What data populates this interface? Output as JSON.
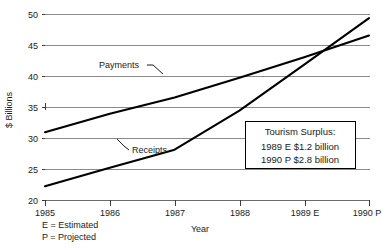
{
  "chart_data": {
    "type": "line",
    "title": "",
    "xlabel": "Year",
    "ylabel": "$ Billions",
    "grid": true,
    "legend_position": "inline-annotation",
    "categories": [
      "1985",
      "1986",
      "1987",
      "1988",
      "1989 E",
      "1990 P"
    ],
    "x": [
      1985,
      1986,
      1987,
      1988,
      1989,
      1990
    ],
    "xlim": [
      1985,
      1990
    ],
    "ylim": [
      20,
      50
    ],
    "yticks": [
      20,
      25,
      30,
      35,
      40,
      45,
      50
    ],
    "xticks": [
      "1985",
      "1986",
      "1987",
      "1988",
      "1989 E",
      "1990 P"
    ],
    "series": [
      {
        "name": "Payments",
        "values": [
          31.0,
          34.0,
          36.6,
          39.8,
          43.1,
          46.6
        ]
      },
      {
        "name": "Receipts",
        "values": [
          22.3,
          25.3,
          28.2,
          34.5,
          41.9,
          49.4
        ]
      }
    ],
    "annotations": [
      {
        "id": "tourism-surplus-callout",
        "title": "Tourism Surplus:",
        "lines": [
          "1989 E $1.2 billion",
          "1990 P $2.8 billion"
        ]
      }
    ],
    "footnotes": [
      "E = Estimated",
      "P = Projected"
    ]
  },
  "axes": {
    "y_label": "$ Billions",
    "x_label": "Year",
    "y_ticks": [
      "50",
      "45",
      "40",
      "35",
      "30",
      "25",
      "20"
    ],
    "x_ticks": [
      "1985",
      "1986",
      "1987",
      "1988",
      "1989 E",
      "1990 P"
    ]
  },
  "series_labels": {
    "payments": "Payments",
    "receipts": "Receipts"
  },
  "callout": {
    "title": "Tourism Surplus:",
    "line1": "1989 E $1.2 billion",
    "line2": "1990 P $2.8 billion"
  },
  "footnotes": {
    "estimated": "E = Estimated",
    "projected": "P = Projected"
  },
  "colors": {
    "line": "#000000",
    "grid": "#8a8a8a",
    "axis": "#6b6b6b",
    "text": "#1a1a1a",
    "background": "#ffffff"
  }
}
